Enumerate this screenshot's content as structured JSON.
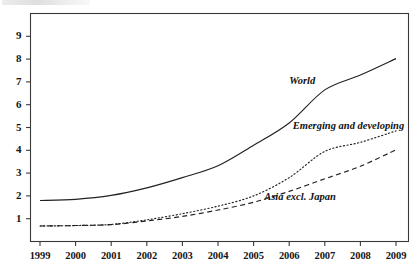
{
  "figure": {
    "background_color": "#ffffff",
    "frame_color": "#3a3a3a",
    "text_color": "#151515"
  },
  "chart_data": {
    "type": "line",
    "title": "",
    "subtitle": "",
    "xlabel": "",
    "ylabel": "",
    "x": [
      1999,
      2000,
      2001,
      2002,
      2003,
      2004,
      2005,
      2006,
      2007,
      2008,
      2009
    ],
    "categories": [
      "1999",
      "2000",
      "2001",
      "2002",
      "2003",
      "2004",
      "2005",
      "2006",
      "2007",
      "2008",
      "2009"
    ],
    "xlim": [
      1999,
      2009
    ],
    "ylim": [
      0,
      10
    ],
    "yticks": [
      1,
      2,
      3,
      4,
      5,
      6,
      7,
      8,
      9
    ],
    "ytick_labels": [
      "1",
      "2",
      "3",
      "4",
      "5",
      "6",
      "7",
      "8",
      "9"
    ],
    "xticks": [
      1999,
      2000,
      2001,
      2002,
      2003,
      2004,
      2005,
      2006,
      2007,
      2008,
      2009
    ],
    "grid": false,
    "legend": "inline-annotations",
    "series": [
      {
        "name": "World",
        "label": "World",
        "style": "solid",
        "color": "#222222",
        "values": [
          1.8,
          1.85,
          2.02,
          2.35,
          2.8,
          3.32,
          4.22,
          5.2,
          6.65,
          7.3,
          8.02
        ]
      },
      {
        "name": "Emerging and developing",
        "label": "Emerging and developing",
        "style": "dotted",
        "color": "#222222",
        "values": [
          0.68,
          0.7,
          0.75,
          0.95,
          1.22,
          1.55,
          2.0,
          2.8,
          3.95,
          4.35,
          4.85
        ]
      },
      {
        "name": "Asia excl. Japan",
        "label": "Asia excl. Japan",
        "style": "dashed",
        "color": "#222222",
        "values": [
          0.68,
          0.7,
          0.74,
          0.9,
          1.1,
          1.38,
          1.72,
          2.2,
          2.75,
          3.3,
          4.02
        ]
      }
    ],
    "annotations": [
      {
        "text": "World",
        "x": 2006.0,
        "y": 7.05
      },
      {
        "text": "Emerging and developing",
        "x": 2006.1,
        "y": 5.05
      },
      {
        "text": "Asia excl. Japan",
        "x": 2005.3,
        "y": 1.95
      }
    ]
  }
}
